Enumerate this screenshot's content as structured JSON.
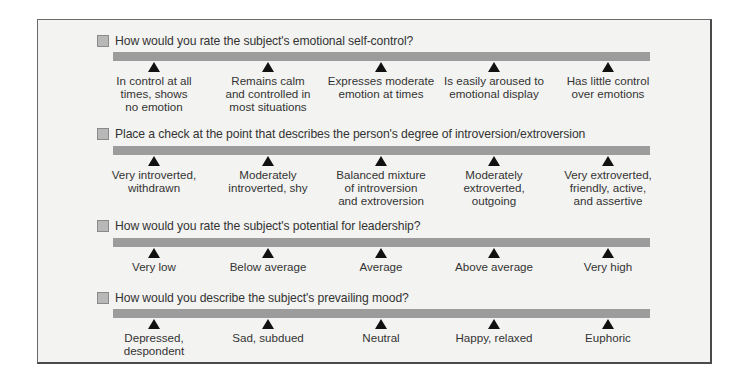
{
  "questions": [
    {
      "text": "How would you rate the subject's emotional self-control?",
      "options": [
        "In control at all\ntimes, shows\nno emotion",
        "Remains calm\nand controlled in\nmost situations",
        "Expresses moderate\nemotion at times",
        "Is easily aroused to\nemotional display",
        "Has little control\nover emotions"
      ]
    },
    {
      "text": "Place a check at the point that describes the person's degree of introversion/extroversion",
      "options": [
        "Very introverted,\nwithdrawn",
        "Moderately\nintroverted, shy",
        "Balanced mixture\nof introversion\nand extroversion",
        "Moderately\nextroverted,\noutgoing",
        "Very extroverted,\nfriendly, active,\nand assertive"
      ]
    },
    {
      "text": "How would you rate the subject's potential for leadership?",
      "options": [
        "Very low",
        "Below average",
        "Average",
        "Above average",
        "Very high"
      ]
    },
    {
      "text": "How would you describe the subject's prevailing mood?",
      "options": [
        "Depressed,\ndespondent",
        "Sad, subdued",
        "Neutral",
        "Happy, relaxed",
        "Euphoric"
      ]
    }
  ],
  "colors": {
    "panel_bg": "#f3f3f2",
    "bar": "#9c9c9c",
    "checkbox": "#b8b8b8",
    "marker": "#111111"
  }
}
